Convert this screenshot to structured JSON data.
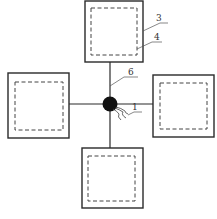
{
  "diagram": {
    "colors": {
      "stroke": "#2a2a2a",
      "node": "#111111",
      "background": "#ffffff"
    },
    "center_node": {
      "cx": 110,
      "cy": 104,
      "r": 7
    },
    "boxes": [
      {
        "id": "top",
        "outer": [
          85,
          1,
          58,
          61
        ],
        "inner": [
          91,
          8,
          46,
          47
        ]
      },
      {
        "id": "left",
        "outer": [
          8,
          73,
          61,
          65
        ],
        "inner": [
          15,
          82,
          48,
          48
        ]
      },
      {
        "id": "right",
        "outer": [
          153,
          75,
          61,
          62
        ],
        "inner": [
          160,
          83,
          47,
          46
        ]
      },
      {
        "id": "bottom",
        "outer": [
          82,
          148,
          61,
          60
        ],
        "inner": [
          88,
          156,
          47,
          45
        ]
      }
    ],
    "labels": {
      "l1": "1",
      "l3": "3",
      "l4": "4",
      "l6": "6"
    }
  }
}
